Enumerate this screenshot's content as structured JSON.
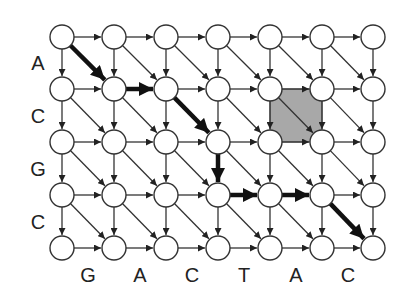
{
  "grid": {
    "cols": 7,
    "rows": 5,
    "x": [
      62,
      114,
      166,
      218,
      270,
      322,
      373
    ],
    "y": [
      37,
      89,
      142,
      195,
      248
    ],
    "node_radius": 12
  },
  "row_labels": [
    {
      "text": "A",
      "x": 38,
      "y": 63
    },
    {
      "text": "C",
      "x": 38,
      "y": 116
    },
    {
      "text": "G",
      "x": 38,
      "y": 169
    },
    {
      "text": "C",
      "x": 38,
      "y": 222
    }
  ],
  "col_labels": [
    {
      "text": "G",
      "x": 88,
      "y": 275
    },
    {
      "text": "A",
      "x": 140,
      "y": 275
    },
    {
      "text": "C",
      "x": 192,
      "y": 275
    },
    {
      "text": "T",
      "x": 244,
      "y": 275
    },
    {
      "text": "A",
      "x": 296,
      "y": 275
    },
    {
      "text": "C",
      "x": 348,
      "y": 275
    }
  ],
  "bold_path": [
    [
      0,
      0
    ],
    [
      1,
      1
    ],
    [
      2,
      1
    ],
    [
      3,
      2
    ],
    [
      3,
      3
    ],
    [
      4,
      3
    ],
    [
      5,
      3
    ],
    [
      6,
      4
    ]
  ],
  "highlight_cell": {
    "col": 4,
    "row": 1
  },
  "colors": {
    "edge": "#333333",
    "bold_edge": "#111111",
    "node_fill": "#ffffff",
    "node_stroke": "#333333",
    "highlight": "#a8a8a8"
  }
}
